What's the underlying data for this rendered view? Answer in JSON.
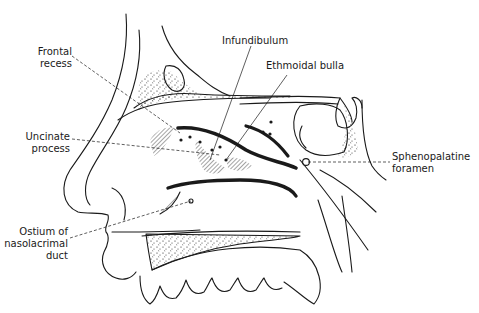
{
  "diagram": {
    "stroke_color": "#1a1a1a",
    "background": "#ffffff",
    "labels": [
      {
        "id": "frontal-recess",
        "lines": [
          "Frontal",
          "recess"
        ],
        "align": "right"
      },
      {
        "id": "infundibulum",
        "lines": [
          "Infundibulum"
        ],
        "align": "left"
      },
      {
        "id": "ethmoidal-bulla",
        "lines": [
          "Ethmoidal bulla"
        ],
        "align": "left"
      },
      {
        "id": "uncinate-process",
        "lines": [
          "Uncinate",
          "process"
        ],
        "align": "right"
      },
      {
        "id": "sphenopalatine-foramen",
        "lines": [
          "Sphenopalatine",
          "foramen"
        ],
        "align": "left"
      },
      {
        "id": "ostium-nasolacrimal-duct",
        "lines": [
          "Ostium of",
          "nasolacrimal",
          "duct"
        ],
        "align": "right"
      }
    ]
  }
}
